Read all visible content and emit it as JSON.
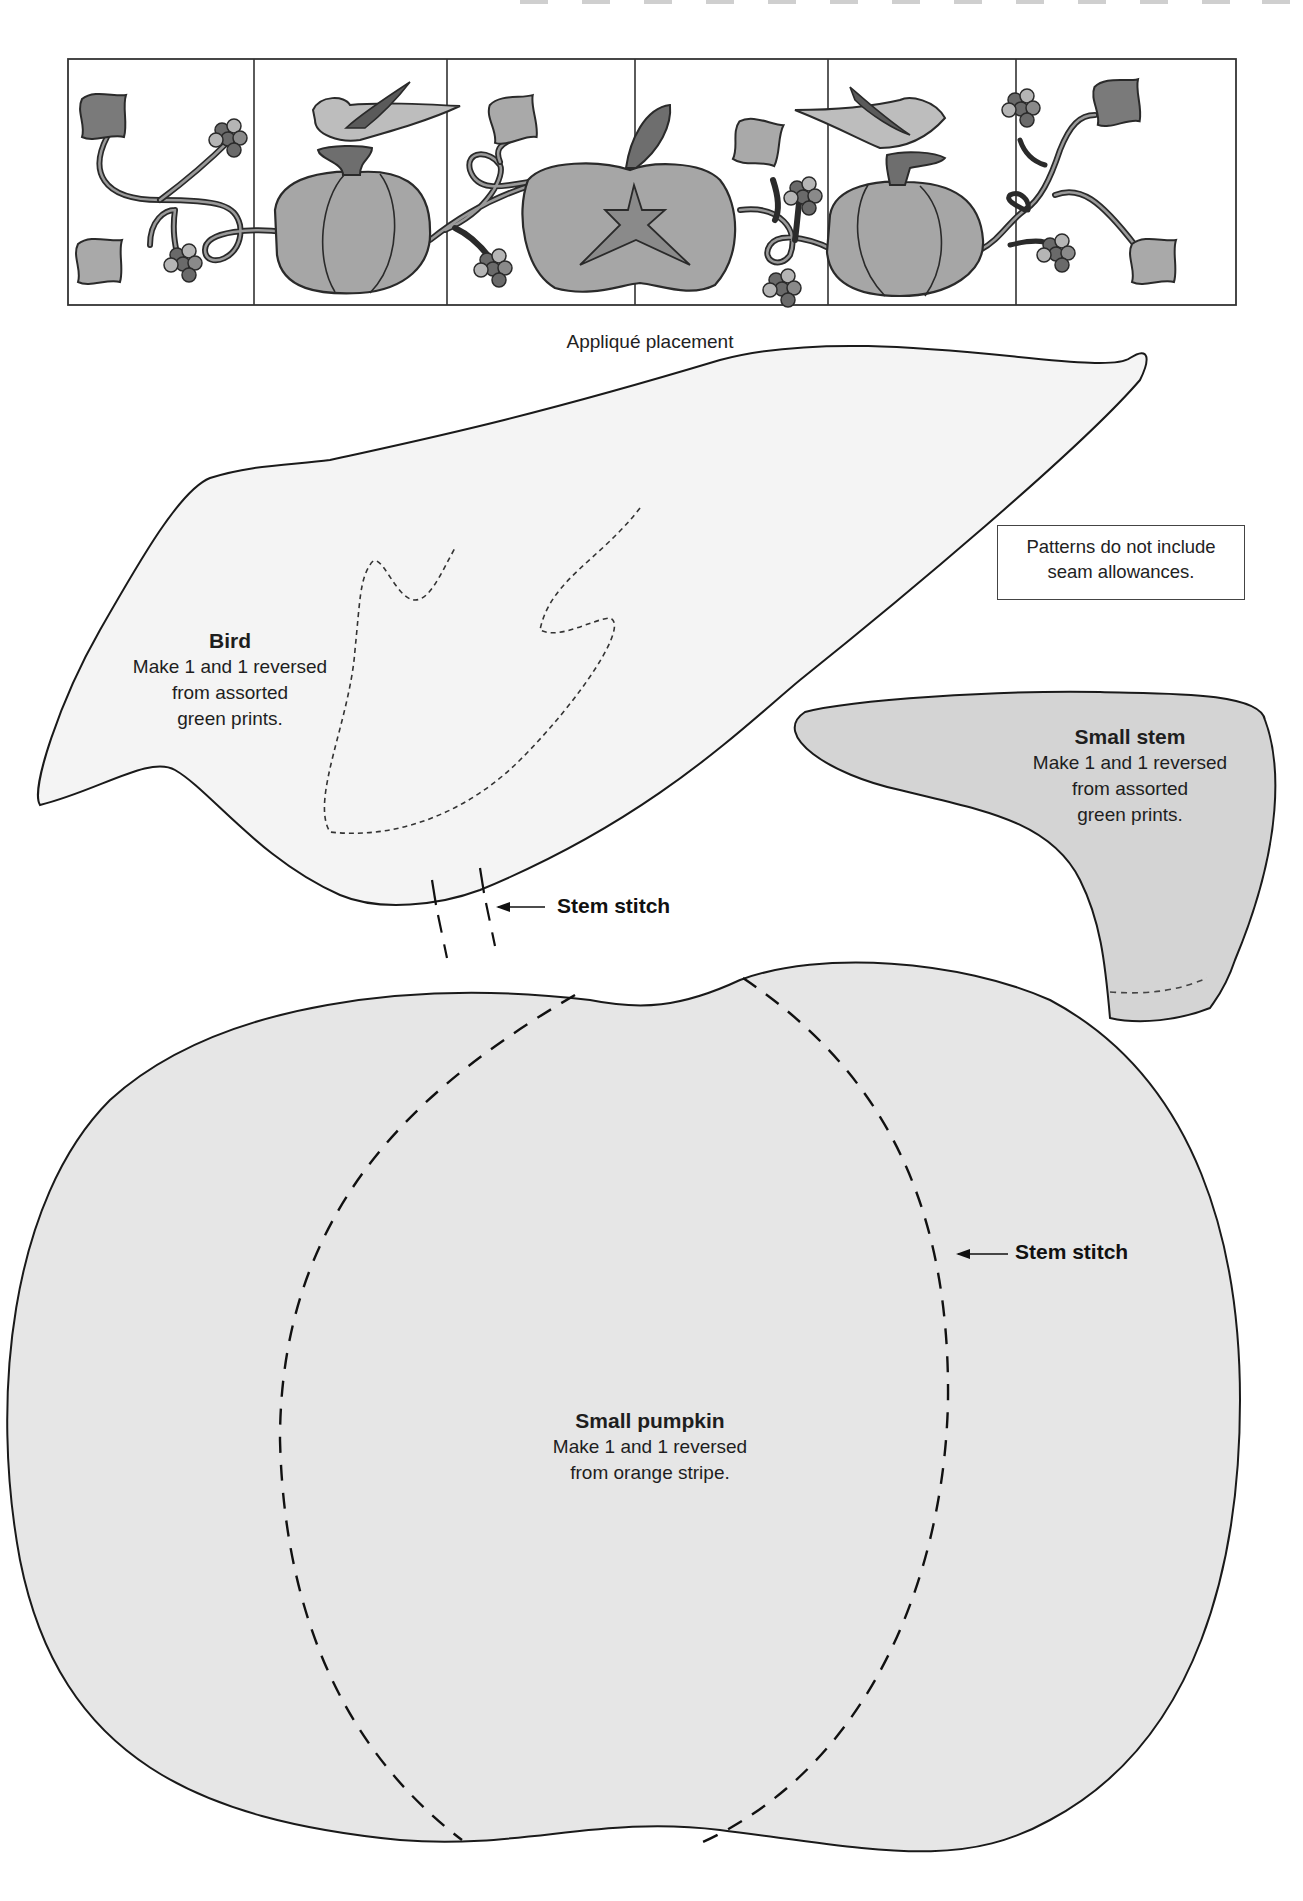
{
  "header": {
    "top_dash_count": 13
  },
  "placement": {
    "caption": "Appliqué placement",
    "block_count": 7,
    "colors": {
      "leaf_dark": "#7a7a7a",
      "leaf_light": "#a9a9a9",
      "pumpkin": "#a6a6a6",
      "bird": "#bdbdbd",
      "stem": "#6e6e6e",
      "berry_dark": "#6a6a6a",
      "berry_light": "#b5b5b5",
      "outline": "#2a2a2a"
    }
  },
  "note": {
    "line1": "Patterns do not include",
    "line2": "seam allowances."
  },
  "bird": {
    "title": "Bird",
    "line1": "Make 1 and 1 reversed",
    "line2": "from assorted",
    "line3": "green prints.",
    "fill": "#f4f4f4",
    "callout": "Stem stitch"
  },
  "small_stem": {
    "title": "Small stem",
    "line1": "Make 1 and 1 reversed",
    "line2": "from assorted",
    "line3": "green prints.",
    "fill": "#d4d4d4"
  },
  "small_pumpkin": {
    "title": "Small pumpkin",
    "line1": "Make 1 and 1 reversed",
    "line2": "from orange stripe.",
    "fill": "#e6e6e6",
    "callout": "Stem stitch"
  }
}
